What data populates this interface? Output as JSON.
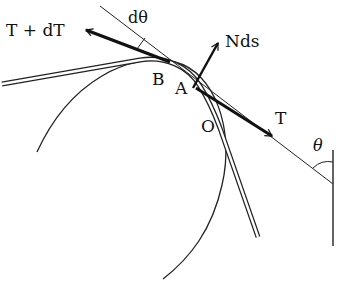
{
  "figure": {
    "colors": {
      "ink": "#111111",
      "background": "#ffffff"
    },
    "labels": {
      "t_plus_dt": "T + dT",
      "d_theta": "dθ",
      "nds": "Nds",
      "point_b": "B",
      "point_a": "A",
      "point_o": "O",
      "tension": "T",
      "theta": "θ"
    },
    "elements": {
      "arrows": [
        "T + dT",
        "Nds",
        "T"
      ],
      "points": [
        "B",
        "A",
        "O"
      ],
      "angles": [
        "dθ",
        "θ"
      ]
    }
  }
}
